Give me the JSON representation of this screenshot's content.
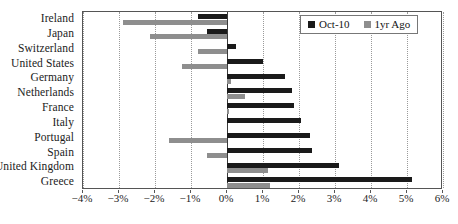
{
  "chart_data": {
    "type": "bar",
    "orientation": "horizontal",
    "title": "",
    "xlabel": "",
    "ylabel": "",
    "xlim": [
      -4,
      6
    ],
    "xticks": [
      -4,
      -3,
      -2,
      -1,
      0,
      1,
      2,
      3,
      4,
      5,
      6
    ],
    "xtick_labels": [
      "−4%",
      "−3%",
      "−2%",
      "−1%",
      "0%",
      "1%",
      "2%",
      "3%",
      "4%",
      "5%",
      "6%"
    ],
    "grid": true,
    "legend_position": "top-right",
    "categories": [
      "Ireland",
      "Japan",
      "Switzerland",
      "United States",
      "Germany",
      "Netherlands",
      "France",
      "Italy",
      "Portugal",
      "Spain",
      "United Kingdom",
      "Greece"
    ],
    "series": [
      {
        "name": "Oct-10",
        "color": "#1a1a1a",
        "values": [
          -0.8,
          -0.55,
          0.25,
          1.0,
          1.6,
          1.8,
          1.85,
          2.05,
          2.3,
          2.35,
          3.1,
          5.15
        ]
      },
      {
        "name": "1yr Ago",
        "color": "#8e8e8e",
        "values": [
          -2.9,
          -2.15,
          -0.8,
          -1.25,
          0.1,
          0.5,
          0.05,
          0.0,
          -1.6,
          -0.55,
          1.15,
          1.2
        ]
      }
    ]
  },
  "legend": {
    "entries": [
      {
        "label": "Oct-10",
        "swatch_name": "legend-swatch-current"
      },
      {
        "label": "1yr Ago",
        "swatch_name": "legend-swatch-prior"
      }
    ]
  }
}
